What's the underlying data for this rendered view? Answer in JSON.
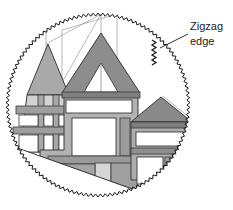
{
  "figure": {
    "background_color": "#ffffff",
    "annotation": {
      "line1": "Zigzag",
      "line2": "edge",
      "text_color": "#1a1a1a",
      "font_size_px": 11,
      "leader_line": {
        "from_x": 188,
        "from_y": 34,
        "to_x": 160,
        "to_y": 48
      },
      "zigzag_symbol": {
        "x": 152,
        "y": 40,
        "teeth": 5,
        "color": "#1a1a1a",
        "description": "small sawtooth glyph indicating the edge style"
      }
    },
    "clip_circle": {
      "center_x": 98,
      "center_y": 105,
      "radius": 92,
      "edge_style": "zigzag",
      "tooth_count": 118,
      "tooth_depth_px": 3,
      "stroke_color": "#1a1a1a",
      "stroke_width_px": 1
    },
    "palette": {
      "outline": "#3a3a3a",
      "thin_guide": "#8c8c8c",
      "white": "#ffffff",
      "light_gray": "#e2e2e2",
      "pale_gray": "#d2d2d2",
      "mid_gray": "#b9b9b9",
      "gray": "#a8a8a8",
      "dark_gray": "#8e8e8e",
      "darker_gray": "#7a7a7a",
      "roof_gray": "#8a8a8a",
      "shadow_gray": "#6f6f6f"
    },
    "shapes": {
      "left_wing": {
        "name": "left-gabled-wing",
        "roof_points": "27,95 48,44 69,95",
        "roof_fill": "#a8a8a8",
        "body_points": "27,95 69,95 69,152 22,152",
        "body_fill": "#cfcfcf"
      },
      "center_gable": {
        "name": "center-gable-roof",
        "points": "64,92 101,33 138,92",
        "fill": "#8e8e8e",
        "inner_triangle_points": "84,92 101,64 118,92",
        "inner_triangle_fill": "#ffffff"
      },
      "center_block": {
        "name": "center-main-block",
        "points": "64,92 138,92 138,178 52,178",
        "fill": "#b0b0b0"
      },
      "right_wing": {
        "name": "right-wing-roof",
        "points": "133,120 163,96 190,120",
        "fill": "#8a8a8a"
      },
      "right_block": {
        "name": "right-wing-block",
        "points": "133,120 190,120 190,176 133,176",
        "fill": "#aeaeae"
      },
      "ground_line": {
        "name": "ground-diagonal",
        "from_x": 14,
        "from_y": 147,
        "to_x": 150,
        "to_y": 196
      }
    }
  }
}
